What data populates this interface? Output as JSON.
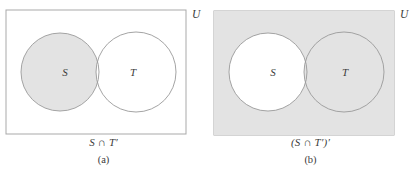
{
  "figure": {
    "type": "venn-diagram-pair",
    "universe_label": "U",
    "set_labels": {
      "left": "S",
      "right": "T"
    },
    "shade_color": "#e3e3e3",
    "stroke_color": "#9a9a9a",
    "text_color": "#3b3b3b",
    "background": "#ffffff"
  },
  "panels": [
    {
      "id": "a",
      "caption_expression": "S ∩ T′",
      "caption_index": "(a)",
      "universe_label": "U",
      "left_circle_label": "S",
      "right_circle_label": "T",
      "shaded_region": "S minus T",
      "rectangle_filled": false,
      "left_circle_filled": true,
      "right_circle_filled": false,
      "intersection_filled": false
    },
    {
      "id": "b",
      "caption_expression": "(S ∩ T′)′",
      "caption_index": "(b)",
      "universe_label": "U",
      "left_circle_label": "S",
      "right_circle_label": "T",
      "shaded_region": "complement of S minus T",
      "rectangle_filled": true,
      "left_circle_filled": false,
      "right_circle_filled": true,
      "intersection_filled": true
    }
  ],
  "geometry": {
    "panel_width": 207,
    "panel_height": 172,
    "rect": {
      "x": 6,
      "y": 10,
      "width": 180,
      "height": 124
    },
    "left_circle": {
      "cx": 60,
      "cy": 72,
      "r": 39
    },
    "right_circle": {
      "cx": 136,
      "cy": 72,
      "r": 40
    },
    "universe_label_pos": {
      "x": 192,
      "y": 17
    }
  }
}
